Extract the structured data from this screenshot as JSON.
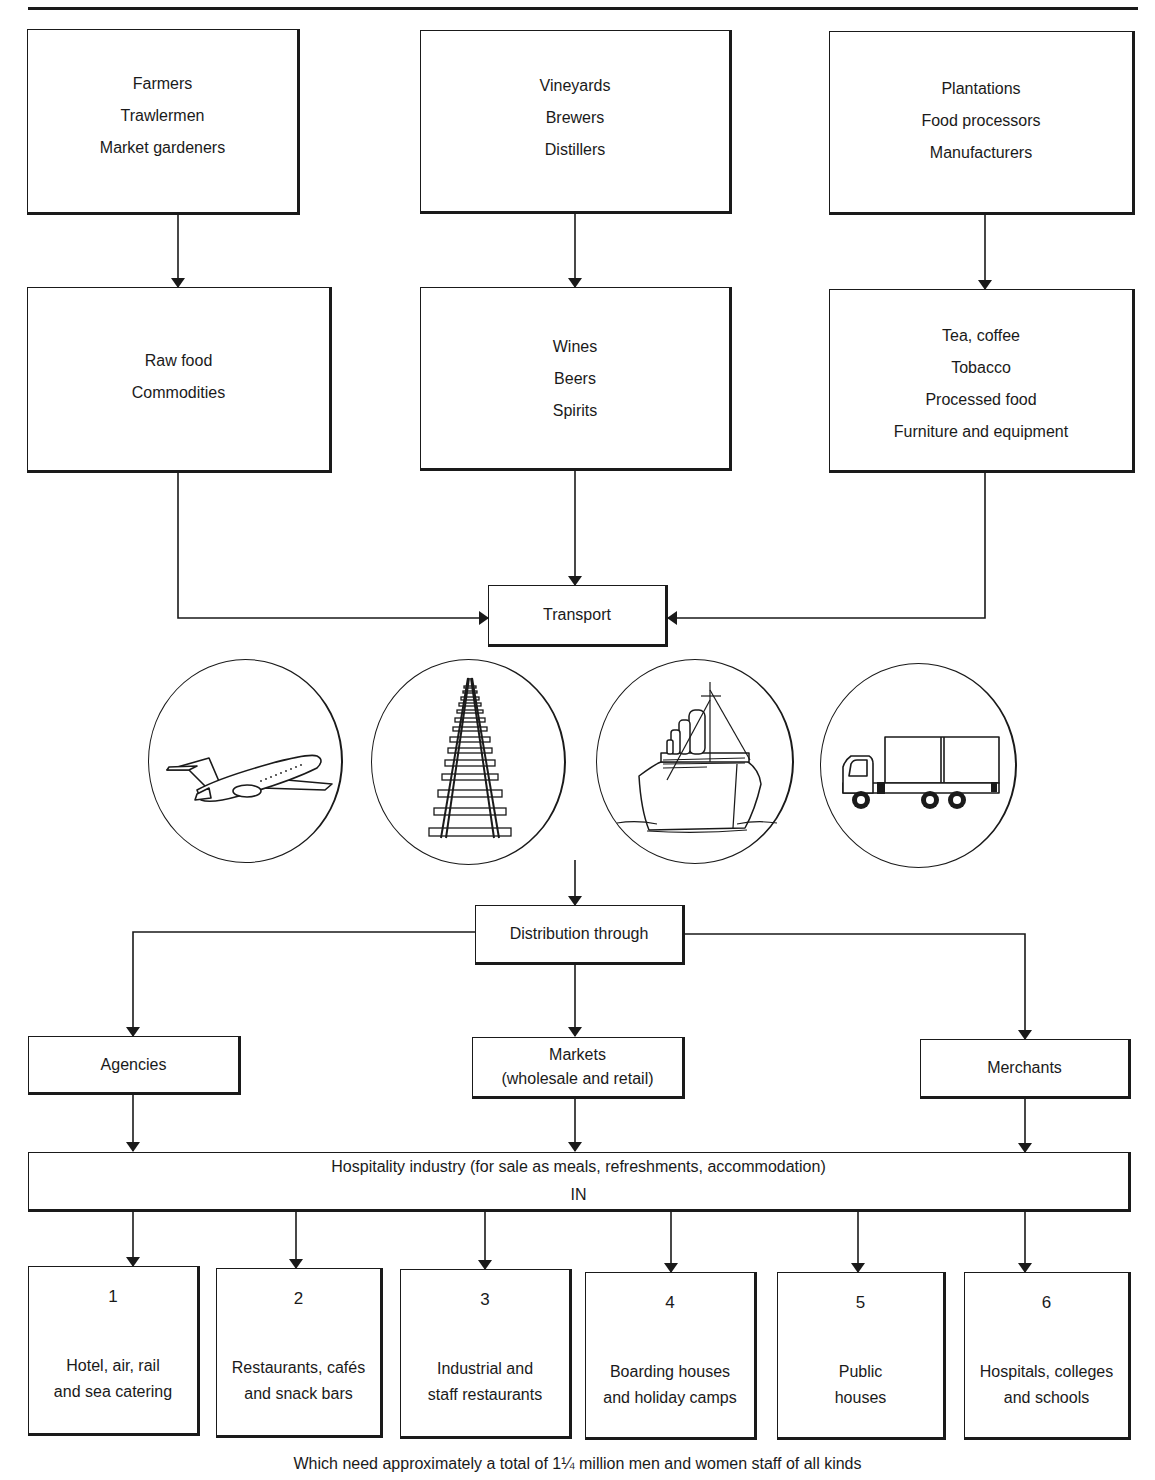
{
  "diagram": {
    "type": "flowchart",
    "title": "",
    "sources": [
      {
        "id": "source-1",
        "lines": [
          "Farmers",
          "Trawlermen",
          "Market gardeners"
        ]
      },
      {
        "id": "source-2",
        "lines": [
          "Vineyards",
          "Brewers",
          "Distillers"
        ]
      },
      {
        "id": "source-3",
        "lines": [
          "Plantations",
          "Food processors",
          "Manufacturers"
        ]
      }
    ],
    "products": [
      {
        "id": "product-1",
        "lines": [
          "Raw food",
          "Commodities"
        ]
      },
      {
        "id": "product-2",
        "lines": [
          "Wines",
          "Beers",
          "Spirits"
        ]
      },
      {
        "id": "product-3",
        "lines": [
          "Tea, coffee",
          "Tobacco",
          "Processed food",
          "Furniture and equipment"
        ]
      }
    ],
    "transport": {
      "label": "Transport",
      "modes": [
        {
          "icon": "airplane-icon",
          "label": "Air"
        },
        {
          "icon": "railway-track-icon",
          "label": "Rail"
        },
        {
          "icon": "ship-icon",
          "label": "Sea"
        },
        {
          "icon": "lorry-icon",
          "label": "Road"
        }
      ]
    },
    "distribution": {
      "label": "Distribution through",
      "channels": [
        {
          "id": "channel-agencies",
          "lines": [
            "Agencies"
          ]
        },
        {
          "id": "channel-markets",
          "lines": [
            "Markets",
            "(wholesale and retail)"
          ]
        },
        {
          "id": "channel-merchants",
          "lines": [
            "Merchants"
          ]
        }
      ]
    },
    "hospitality": {
      "lines": [
        "Hospitality industry (for sale as meals, refreshments, accommodation)",
        "IN"
      ]
    },
    "sectors": [
      {
        "number": "1",
        "lines": [
          "Hotel, air, rail",
          "and sea catering"
        ]
      },
      {
        "number": "2",
        "lines": [
          "Restaurants, cafés",
          "and snack bars"
        ]
      },
      {
        "number": "3",
        "lines": [
          "Industrial and",
          "staff restaurants"
        ]
      },
      {
        "number": "4",
        "lines": [
          "Boarding houses",
          "and holiday camps"
        ]
      },
      {
        "number": "5",
        "lines": [
          "Public",
          "houses"
        ]
      },
      {
        "number": "6",
        "lines": [
          "Hospitals, colleges",
          "and schools"
        ]
      }
    ],
    "caption": "Which need approximately a total of 1¼ million men and women staff of all kinds",
    "edges": [
      [
        "source-1",
        "product-1"
      ],
      [
        "source-2",
        "product-2"
      ],
      [
        "source-3",
        "product-3"
      ],
      [
        "product-1",
        "transport"
      ],
      [
        "product-2",
        "transport"
      ],
      [
        "product-3",
        "transport"
      ],
      [
        "transport",
        "distribution"
      ],
      [
        "distribution",
        "channel-agencies"
      ],
      [
        "distribution",
        "channel-markets"
      ],
      [
        "distribution",
        "channel-merchants"
      ],
      [
        "channel-agencies",
        "hospitality"
      ],
      [
        "channel-markets",
        "hospitality"
      ],
      [
        "channel-merchants",
        "hospitality"
      ],
      [
        "hospitality",
        "sector-1"
      ],
      [
        "hospitality",
        "sector-2"
      ],
      [
        "hospitality",
        "sector-3"
      ],
      [
        "hospitality",
        "sector-4"
      ],
      [
        "hospitality",
        "sector-5"
      ],
      [
        "hospitality",
        "sector-6"
      ]
    ]
  }
}
